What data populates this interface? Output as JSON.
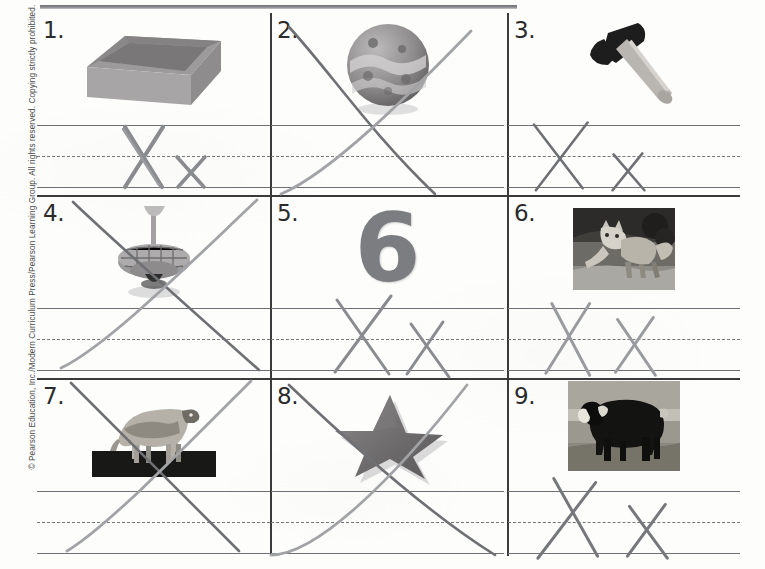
{
  "page": {
    "type": "handwriting-practice-worksheet",
    "letter_practiced": "Xx",
    "copyright": "© Pearson Education, Inc./Modern Curriculum Press/Pearson Learning Group. All rights reserved. Copying strictly prohibited.",
    "paper_color": "#fdfdfc",
    "rule_line_color": "#6f7073",
    "divider_color": "#3a3a3a",
    "pencil_color": "#8a8b8f",
    "pencil_dark_color": "#6c6d71"
  },
  "grid": {
    "rows": 3,
    "columns": 3,
    "cells": [
      {
        "number": "1.",
        "picture": "box",
        "picture_label": "box",
        "writing": "Xx",
        "stroke_style": "letters-on-lines"
      },
      {
        "number": "2.",
        "picture": "ball",
        "picture_label": "ball",
        "writing": "X",
        "stroke_style": "oversized-x-across-cell"
      },
      {
        "number": "3.",
        "picture": "axe",
        "picture_label": "axe",
        "writing": "Xx",
        "stroke_style": "letters-on-lines"
      },
      {
        "number": "4.",
        "picture": "top",
        "picture_label": "top",
        "writing": "X",
        "stroke_style": "oversized-x-across-cell"
      },
      {
        "number": "5.",
        "picture": "six",
        "picture_label": "six",
        "writing": "Xx",
        "stroke_style": "letters-on-lines"
      },
      {
        "number": "6.",
        "picture": "fox",
        "picture_label": "fox",
        "writing": "Xx",
        "stroke_style": "letters-on-lines"
      },
      {
        "number": "7.",
        "picture": "ox",
        "picture_label": "ox",
        "writing": "X",
        "stroke_style": "oversized-x-across-cell"
      },
      {
        "number": "8.",
        "picture": "star",
        "picture_label": "star",
        "writing": "X",
        "stroke_style": "oversized-x-across-cell"
      },
      {
        "number": "9.",
        "picture": "musk-ox",
        "picture_label": "musk ox",
        "writing": "Xx",
        "stroke_style": "letters-on-lines"
      }
    ]
  }
}
